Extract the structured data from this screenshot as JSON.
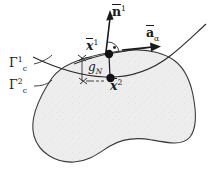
{
  "figure": {
    "width": 213,
    "height": 172,
    "background_color": "#ffffff",
    "stroke_color": "#1a1a1a",
    "body_fill_color": "#ededed",
    "body_edge_color": "#3a3a3a"
  },
  "labels": {
    "normal_vector": {
      "base": "n",
      "overbar": true,
      "superscript": "1",
      "text": "n̉1"
    },
    "tangent_vector": {
      "base": "a",
      "overbar": true,
      "subscript": "α",
      "text": "āα"
    },
    "point_slave": {
      "base": "x",
      "overbar": true,
      "superscript": "1",
      "text": "x̄1"
    },
    "point_master": {
      "base": "x",
      "overbar": true,
      "superscript": "2",
      "text": "x̄2"
    },
    "gap": {
      "base": "g",
      "subscript": "N",
      "text": "gN"
    },
    "surface_one": {
      "base": "Γ",
      "superscript": "1",
      "subscript": "c",
      "text": "Γ1c"
    },
    "surface_two": {
      "base": "Γ",
      "superscript": "2",
      "subscript": "c",
      "text": "Γ2c"
    }
  },
  "elements": {
    "right_angle_marker": "right-angle-arc-with-dot",
    "gap_dimension_ticks": 2,
    "contact_points": 2
  },
  "geometry": {
    "point_x1": {
      "x": 109,
      "y": 54
    },
    "point_x2": {
      "x": 110,
      "y": 78
    },
    "normal_arrow_tip": {
      "x": 110,
      "y": 12
    },
    "tangent_arrow_tip": {
      "x": 160,
      "y": 48
    }
  }
}
